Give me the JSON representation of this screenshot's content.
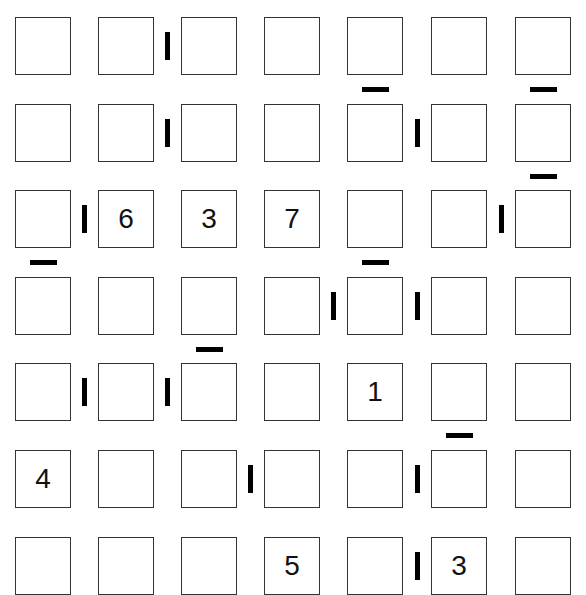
{
  "puzzle": {
    "rows": 7,
    "cols": 7,
    "cells": [
      [
        "",
        "",
        "",
        "",
        "",
        "",
        ""
      ],
      [
        "",
        "",
        "",
        "",
        "",
        "",
        ""
      ],
      [
        "",
        "6",
        "3",
        "7",
        "",
        "",
        ""
      ],
      [
        "",
        "",
        "",
        "",
        "",
        "",
        ""
      ],
      [
        "",
        "",
        "",
        "",
        "1",
        "",
        ""
      ],
      [
        "4",
        "",
        "",
        "",
        "",
        "",
        ""
      ],
      [
        "",
        "",
        "",
        "5",
        "",
        "3",
        ""
      ]
    ],
    "vertical_bars": [
      {
        "row": 0,
        "between_cols": [
          1,
          2
        ]
      },
      {
        "row": 1,
        "between_cols": [
          1,
          2
        ]
      },
      {
        "row": 1,
        "between_cols": [
          4,
          5
        ]
      },
      {
        "row": 2,
        "between_cols": [
          0,
          1
        ]
      },
      {
        "row": 2,
        "between_cols": [
          5,
          6
        ]
      },
      {
        "row": 3,
        "between_cols": [
          3,
          4
        ]
      },
      {
        "row": 3,
        "between_cols": [
          4,
          5
        ]
      },
      {
        "row": 4,
        "between_cols": [
          0,
          1
        ]
      },
      {
        "row": 4,
        "between_cols": [
          1,
          2
        ]
      },
      {
        "row": 5,
        "between_cols": [
          2,
          3
        ]
      },
      {
        "row": 5,
        "between_cols": [
          4,
          5
        ]
      },
      {
        "row": 6,
        "between_cols": [
          4,
          5
        ]
      }
    ],
    "horizontal_bars": [
      {
        "col": 4,
        "between_rows": [
          0,
          1
        ]
      },
      {
        "col": 6,
        "between_rows": [
          0,
          1
        ]
      },
      {
        "col": 6,
        "between_rows": [
          1,
          2
        ]
      },
      {
        "col": 0,
        "between_rows": [
          2,
          3
        ]
      },
      {
        "col": 4,
        "between_rows": [
          2,
          3
        ]
      },
      {
        "col": 2,
        "between_rows": [
          3,
          4
        ]
      },
      {
        "col": 5,
        "between_rows": [
          4,
          5
        ]
      }
    ],
    "colors": {
      "cell_border": "#333333",
      "bar": "#000000",
      "background": "#ffffff"
    }
  }
}
